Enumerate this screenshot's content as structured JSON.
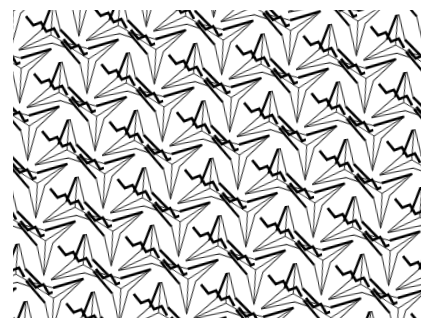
{
  "image": {
    "description": "Tessellation of three-armed propeller / triangular star shapes with shaded bevel edges",
    "background_color": "#ffffff",
    "line_color": "#1a1a1a",
    "shadow_color": "#000000",
    "pattern_bounds": {
      "x": 13,
      "y": 10,
      "width": 408,
      "height": 308
    }
  }
}
